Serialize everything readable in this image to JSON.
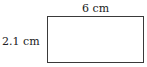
{
  "diagram": {
    "shape": "rectangle",
    "width_label": "6 cm",
    "height_label": "2.1 cm",
    "stroke_color": "#3a3a3a"
  }
}
